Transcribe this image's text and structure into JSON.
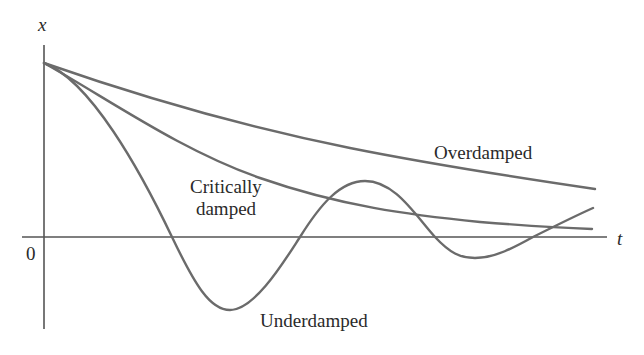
{
  "diagram": {
    "title": "",
    "axes": {
      "y_label": "x",
      "x_label": "t",
      "origin_label": "0"
    },
    "curves": [
      {
        "name": "overdamped",
        "label": "Overdamped"
      },
      {
        "name": "critically-damped",
        "label_line1": "Critically",
        "label_line2": "damped"
      },
      {
        "name": "underdamped",
        "label": "Underdamped"
      }
    ],
    "colors": {
      "curve": "#6b6b6b",
      "axis": "#555555",
      "text": "#2a2a2a",
      "background": "#ffffff"
    }
  },
  "labels": {
    "y_axis": "x",
    "x_axis": "t",
    "origin": "0",
    "overdamped": "Overdamped",
    "critical_line1": "Critically",
    "critical_line2": "damped",
    "underdamped": "Underdamped"
  }
}
